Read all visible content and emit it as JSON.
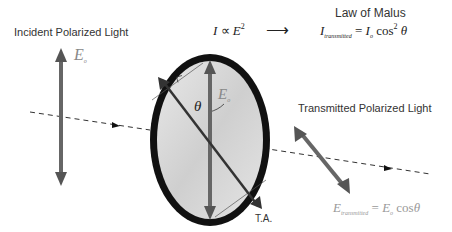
{
  "labels": {
    "incident": "Incident Polarized Light",
    "transmitted": "Transmitted Polarized Light",
    "law_title": "Law of Malus",
    "ta": "T.A."
  },
  "equations": {
    "proportional": {
      "lhs": "I",
      "op": "∝",
      "rhs": "E",
      "exp": "2"
    },
    "law": {
      "lhs": "I",
      "lhs_sub": "transmitted",
      "eq": "=",
      "rhs": "I",
      "rhs_sub": "o",
      "fn": "cos",
      "exp": "2",
      "var": "θ"
    },
    "field_transmitted": {
      "lhs": "E",
      "lhs_sub": "transmitted",
      "eq": "=",
      "rhs": "E",
      "rhs_sub": "o",
      "fn": "cos",
      "var": "θ"
    }
  },
  "symbols": {
    "incident_field": "E",
    "incident_field_sub": "o",
    "polarizer_field": "E",
    "polarizer_field_sub": "o",
    "angle": "θ",
    "arrow": "⟶"
  }
}
